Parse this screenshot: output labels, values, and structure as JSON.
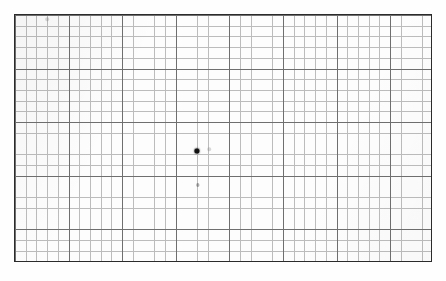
{
  "document": {
    "title": "Graph Paper Plot",
    "paper_background": "#fdfdfd",
    "border_color": "#2b2b2b",
    "minor_grid_color": "#b9b9b9",
    "major_grid_color": "#6f6f6f"
  },
  "chart_data": {
    "type": "scatter",
    "title": "",
    "subtitle": "",
    "xlabel": "",
    "ylabel": "",
    "grid": true,
    "legend": "none",
    "axis_tick_labels": {
      "x": [],
      "y": []
    },
    "grid_spec": {
      "minor_cell_px": 10.72,
      "major_every_n_cells": 5,
      "columns": 39,
      "rows": 23,
      "plot_left_px": 14,
      "plot_top_px": 14,
      "plot_width_px": 418,
      "plot_height_px": 248
    },
    "xlim": [
      0,
      39
    ],
    "ylim": [
      0,
      23
    ],
    "series": [
      {
        "name": "data point",
        "style": "filled-circle",
        "color": "#111111",
        "points": [
          {
            "label": "p1",
            "x_cell": 17.0,
            "y_cell": 12.6,
            "px_x": 196,
            "px_y": 150
          }
        ]
      }
    ],
    "annotations": [
      {
        "kind": "faint-speck",
        "px_x": 46,
        "px_y": 18,
        "note": "light pencil speck near top-left"
      },
      {
        "kind": "faint-speck",
        "px_x": 208,
        "px_y": 148,
        "note": "light speck right of main point"
      },
      {
        "kind": "smudge",
        "px_x": 197,
        "px_y": 184,
        "note": "faint grey smudge below main point"
      }
    ]
  }
}
